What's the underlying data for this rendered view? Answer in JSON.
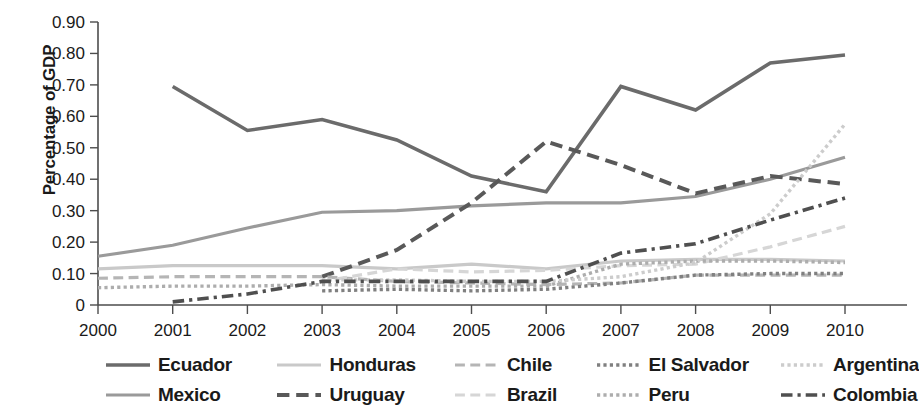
{
  "chart_data": {
    "type": "line",
    "title": "",
    "xlabel": "",
    "ylabel": "Percentage of GDP",
    "x": [
      2000,
      2001,
      2002,
      2003,
      2004,
      2005,
      2006,
      2007,
      2008,
      2009,
      2010
    ],
    "xtick_labels": [
      "2000",
      "2001",
      "2002",
      "2003",
      "2004",
      "2005",
      "2006",
      "2007",
      "2008",
      "2009",
      "2010"
    ],
    "ytick_labels": [
      "0",
      "0.10",
      "0.20",
      "0.30",
      "0.40",
      "0.50",
      "0.60",
      "0.70",
      "0.80",
      "0.90"
    ],
    "ytick_values": [
      0,
      0.1,
      0.2,
      0.3,
      0.4,
      0.5,
      0.6,
      0.7,
      0.8,
      0.9
    ],
    "ylim": [
      0,
      0.9
    ],
    "xlim": [
      2000,
      2010
    ],
    "grid": false,
    "legend_position": "bottom",
    "series": [
      {
        "name": "Ecuador",
        "color": "#6b6b6b",
        "style": "solid",
        "width": 3.6,
        "x": [
          2001,
          2002,
          2003,
          2004,
          2005,
          2006,
          2007,
          2008,
          2009,
          2010
        ],
        "values": [
          0.695,
          0.555,
          0.59,
          0.525,
          0.41,
          0.36,
          0.695,
          0.62,
          0.77,
          0.795
        ]
      },
      {
        "name": "Mexico",
        "color": "#9a9a9a",
        "style": "solid",
        "width": 3.2,
        "x": [
          2000,
          2001,
          2002,
          2003,
          2004,
          2005,
          2006,
          2007,
          2008,
          2009,
          2010
        ],
        "values": [
          0.155,
          0.19,
          0.245,
          0.295,
          0.3,
          0.315,
          0.325,
          0.325,
          0.345,
          0.4,
          0.47
        ]
      },
      {
        "name": "Honduras",
        "color": "#c9c9c9",
        "style": "solid",
        "width": 3.2,
        "x": [
          2000,
          2001,
          2002,
          2003,
          2004,
          2005,
          2006,
          2007,
          2008,
          2009,
          2010
        ],
        "values": [
          0.115,
          0.125,
          0.125,
          0.125,
          0.115,
          0.13,
          0.115,
          0.14,
          0.145,
          0.145,
          0.14
        ]
      },
      {
        "name": "Uruguay",
        "color": "#595959",
        "style": "dashed",
        "width": 4.0,
        "x": [
          2003,
          2004,
          2005,
          2006,
          2007,
          2008,
          2009,
          2010
        ],
        "values": [
          0.09,
          0.175,
          0.325,
          0.52,
          0.445,
          0.355,
          0.41,
          0.385
        ]
      },
      {
        "name": "Chile",
        "color": "#b5b5b5",
        "style": "dashed",
        "width": 3.2,
        "x": [
          2000,
          2001,
          2002,
          2003,
          2004,
          2005,
          2006,
          2007,
          2008,
          2009,
          2010
        ],
        "values": [
          0.085,
          0.09,
          0.09,
          0.09,
          0.075,
          0.07,
          0.065,
          0.07,
          0.095,
          0.095,
          0.095
        ]
      },
      {
        "name": "Brazil",
        "color": "#d6d6d6",
        "style": "dashed",
        "width": 3.2,
        "x": [
          2003,
          2004,
          2005,
          2006,
          2007,
          2008,
          2009,
          2010
        ],
        "values": [
          0.075,
          0.115,
          0.105,
          0.11,
          0.125,
          0.13,
          0.185,
          0.25
        ]
      },
      {
        "name": "El Salvador",
        "color": "#808080",
        "style": "dotted",
        "width": 3.4,
        "x": [
          2003,
          2004,
          2005,
          2006,
          2007,
          2008,
          2009,
          2010
        ],
        "values": [
          0.045,
          0.05,
          0.045,
          0.05,
          0.07,
          0.095,
          0.1,
          0.1
        ]
      },
      {
        "name": "Peru",
        "color": "#adadad",
        "style": "dotted",
        "width": 3.4,
        "x": [
          2000,
          2001,
          2002,
          2003,
          2004,
          2005,
          2006,
          2007,
          2008,
          2009,
          2010
        ],
        "values": [
          0.055,
          0.06,
          0.06,
          0.065,
          0.06,
          0.06,
          0.06,
          0.13,
          0.14,
          0.14,
          0.135
        ]
      },
      {
        "name": "Argentina",
        "color": "#cccccc",
        "style": "dotted",
        "width": 3.4,
        "x": [
          2003,
          2004,
          2005,
          2006,
          2007,
          2008,
          2009,
          2010
        ],
        "values": [
          0.08,
          0.08,
          0.075,
          0.075,
          0.09,
          0.135,
          0.29,
          0.575
        ]
      },
      {
        "name": "Colombia",
        "color": "#4f4f4f",
        "style": "dashdot",
        "width": 3.6,
        "x": [
          2001,
          2002,
          2003,
          2004,
          2005,
          2006,
          2007,
          2008,
          2009,
          2010
        ],
        "values": [
          0.01,
          0.035,
          0.075,
          0.075,
          0.075,
          0.075,
          0.165,
          0.195,
          0.27,
          0.34
        ]
      }
    ]
  },
  "legend": {
    "rows": [
      [
        {
          "label": "Ecuador",
          "series": "Ecuador"
        },
        {
          "label": "Honduras",
          "series": "Honduras"
        },
        {
          "label": "Chile",
          "series": "Chile"
        },
        {
          "label": "El Salvador",
          "series": "El Salvador"
        },
        {
          "label": "Argentina",
          "series": "Argentina"
        }
      ],
      [
        {
          "label": "Mexico",
          "series": "Mexico"
        },
        {
          "label": "Uruguay",
          "series": "Uruguay"
        },
        {
          "label": "Brazil",
          "series": "Brazil"
        },
        {
          "label": "Peru",
          "series": "Peru"
        },
        {
          "label": "Colombia",
          "series": "Colombia"
        }
      ]
    ]
  }
}
